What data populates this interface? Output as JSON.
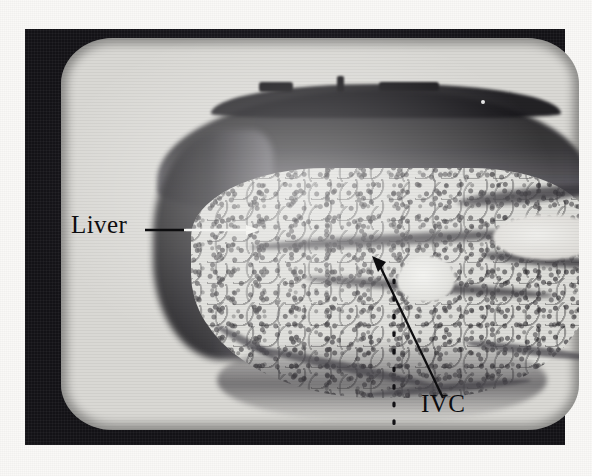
{
  "figure": {
    "kind": "ultrasound-photograph",
    "modality": "B-mode abdominal ultrasound displayed on a CRT monitor",
    "background_color": "#faf9f7",
    "bezel_color": "#17161a",
    "screen_color": "#d9d8d4",
    "annotation_color": "#0d0d0f"
  },
  "annotations": {
    "liver": {
      "label": "Liver",
      "leader": "horizontal-arrow-right",
      "points_to": "liver-parenchyma"
    },
    "ivc": {
      "label": "IVC",
      "leader": "diagonal-arrow-up-left",
      "points_to": "inferior-vena-cava"
    }
  },
  "markers": {
    "centerline": {
      "name": "dotted-depth-marker",
      "orientation": "vertical",
      "style": "dotted"
    }
  }
}
